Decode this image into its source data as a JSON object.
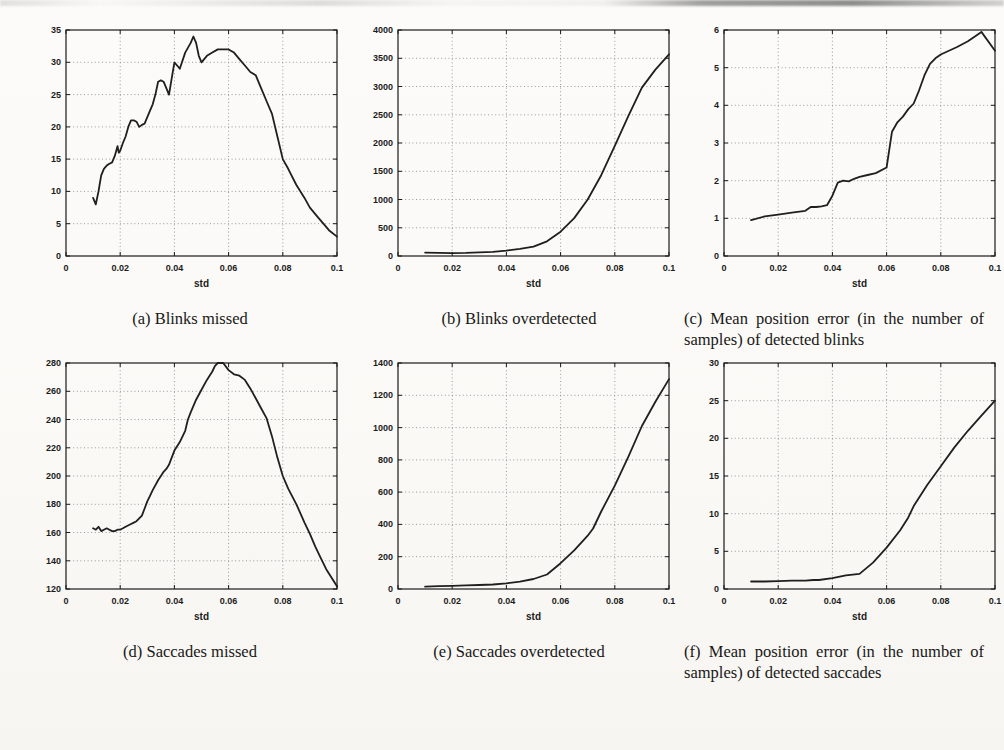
{
  "page": {
    "background": "#faf9f6",
    "scan_band_color": "#7a7a7a",
    "curve_color": "#1f1f1f",
    "grid_color": "#8f8f8f"
  },
  "chart_data": [
    {
      "id": "a",
      "type": "line",
      "caption": "(a) Blinks missed",
      "title": "",
      "xlabel": "std",
      "ylabel": "",
      "xlim": [
        0,
        0.1
      ],
      "ylim": [
        0,
        35
      ],
      "xticks": [
        0,
        0.02,
        0.04,
        0.06,
        0.08,
        0.1
      ],
      "xtick_labels": [
        "0",
        "0.02",
        "0.04",
        "0.06",
        "0.08",
        "0.1"
      ],
      "yticks": [
        0,
        5,
        10,
        15,
        20,
        25,
        30,
        35
      ],
      "ytick_labels": [
        "0",
        "5",
        "10",
        "15",
        "20",
        "25",
        "30",
        "35"
      ],
      "grid": "dotted",
      "legend": "none",
      "x": [
        0.01,
        0.011,
        0.012,
        0.013,
        0.014,
        0.015,
        0.016,
        0.017,
        0.018,
        0.019,
        0.0195,
        0.02,
        0.021,
        0.022,
        0.023,
        0.024,
        0.025,
        0.026,
        0.027,
        0.028,
        0.029,
        0.03,
        0.031,
        0.032,
        0.033,
        0.034,
        0.035,
        0.036,
        0.037,
        0.038,
        0.039,
        0.04,
        0.041,
        0.042,
        0.044,
        0.046,
        0.047,
        0.048,
        0.049,
        0.05,
        0.052,
        0.054,
        0.056,
        0.058,
        0.06,
        0.062,
        0.064,
        0.066,
        0.068,
        0.07,
        0.072,
        0.074,
        0.076,
        0.078,
        0.08,
        0.082,
        0.085,
        0.088,
        0.09,
        0.093,
        0.095,
        0.097,
        0.1
      ],
      "y": [
        9,
        8,
        10,
        12.5,
        13.5,
        14,
        14.3,
        14.5,
        15.5,
        17,
        16,
        16.3,
        17.5,
        18.5,
        20,
        21,
        21,
        20.8,
        20,
        20.3,
        20.5,
        21.5,
        22.5,
        23.5,
        25,
        27,
        27.2,
        27,
        26,
        25,
        27.5,
        30,
        29.5,
        29,
        31.5,
        33,
        34,
        33,
        31,
        30,
        31,
        31.5,
        32,
        32,
        32,
        31.5,
        30.5,
        29.5,
        28.5,
        28,
        26,
        24,
        22,
        18.5,
        15,
        13.5,
        11,
        9,
        7.5,
        6,
        5,
        4,
        3
      ]
    },
    {
      "id": "b",
      "type": "line",
      "caption": "(b) Blinks overdetected",
      "title": "",
      "xlabel": "std",
      "ylabel": "",
      "xlim": [
        0,
        0.1
      ],
      "ylim": [
        0,
        4000
      ],
      "xticks": [
        0,
        0.02,
        0.04,
        0.06,
        0.08,
        0.1
      ],
      "xtick_labels": [
        "0",
        "0.02",
        "0.04",
        "0.06",
        "0.08",
        "0.1"
      ],
      "yticks": [
        0,
        500,
        1000,
        1500,
        2000,
        2500,
        3000,
        3500,
        4000
      ],
      "ytick_labels": [
        "0",
        "500",
        "1000",
        "1500",
        "2000",
        "2500",
        "3000",
        "3500",
        "4000"
      ],
      "grid": "dotted",
      "legend": "none",
      "x": [
        0.01,
        0.015,
        0.02,
        0.025,
        0.03,
        0.035,
        0.04,
        0.045,
        0.05,
        0.055,
        0.06,
        0.065,
        0.07,
        0.075,
        0.08,
        0.085,
        0.09,
        0.095,
        0.1
      ],
      "y": [
        60,
        55,
        50,
        55,
        65,
        75,
        95,
        125,
        165,
        260,
        430,
        670,
        1000,
        1430,
        1950,
        2480,
        2980,
        3300,
        3570
      ]
    },
    {
      "id": "c",
      "type": "line",
      "caption": "(c) Mean position error (in the number of samples) of detected blinks",
      "title": "",
      "xlabel": "std",
      "ylabel": "",
      "xlim": [
        0,
        0.1
      ],
      "ylim": [
        0,
        6
      ],
      "xticks": [
        0,
        0.02,
        0.04,
        0.06,
        0.08,
        0.1
      ],
      "xtick_labels": [
        "0",
        "0.02",
        "0.04",
        "0.06",
        "0.08",
        "0.1"
      ],
      "yticks": [
        0,
        1,
        2,
        3,
        4,
        5,
        6
      ],
      "ytick_labels": [
        "0",
        "1",
        "2",
        "3",
        "4",
        "5",
        "6"
      ],
      "grid": "dotted",
      "legend": "none",
      "x": [
        0.01,
        0.015,
        0.02,
        0.025,
        0.03,
        0.032,
        0.034,
        0.036,
        0.038,
        0.04,
        0.042,
        0.044,
        0.046,
        0.048,
        0.05,
        0.053,
        0.056,
        0.06,
        0.062,
        0.064,
        0.066,
        0.068,
        0.07,
        0.072,
        0.074,
        0.076,
        0.078,
        0.08,
        0.083,
        0.086,
        0.09,
        0.093,
        0.095,
        0.1
      ],
      "y": [
        0.95,
        1.05,
        1.1,
        1.15,
        1.2,
        1.3,
        1.3,
        1.32,
        1.35,
        1.6,
        1.95,
        2.0,
        1.98,
        2.05,
        2.1,
        2.15,
        2.2,
        2.35,
        3.3,
        3.55,
        3.7,
        3.9,
        4.05,
        4.4,
        4.8,
        5.1,
        5.25,
        5.35,
        5.45,
        5.55,
        5.7,
        5.85,
        5.95,
        5.45
      ]
    },
    {
      "id": "d",
      "type": "line",
      "caption": "(d) Saccades missed",
      "title": "",
      "xlabel": "std",
      "ylabel": "",
      "xlim": [
        0,
        0.1
      ],
      "ylim": [
        120,
        280
      ],
      "xticks": [
        0,
        0.02,
        0.04,
        0.06,
        0.08,
        0.1
      ],
      "xtick_labels": [
        "0",
        "0.02",
        "0.04",
        "0.06",
        "0.08",
        "0.1"
      ],
      "yticks": [
        120,
        140,
        160,
        180,
        200,
        220,
        240,
        260,
        280
      ],
      "ytick_labels": [
        "120",
        "140",
        "160",
        "180",
        "200",
        "220",
        "240",
        "260",
        "280"
      ],
      "grid": "dotted",
      "legend": "none",
      "x": [
        0.01,
        0.011,
        0.012,
        0.013,
        0.014,
        0.015,
        0.016,
        0.017,
        0.018,
        0.019,
        0.02,
        0.021,
        0.022,
        0.024,
        0.025,
        0.026,
        0.027,
        0.028,
        0.029,
        0.03,
        0.031,
        0.032,
        0.034,
        0.035,
        0.036,
        0.037,
        0.038,
        0.039,
        0.04,
        0.042,
        0.044,
        0.045,
        0.046,
        0.048,
        0.05,
        0.052,
        0.054,
        0.055,
        0.056,
        0.058,
        0.06,
        0.062,
        0.064,
        0.066,
        0.068,
        0.07,
        0.072,
        0.074,
        0.076,
        0.078,
        0.08,
        0.082,
        0.085,
        0.088,
        0.09,
        0.092,
        0.094,
        0.096,
        0.098,
        0.1
      ],
      "y": [
        163,
        162,
        164,
        161,
        162,
        163,
        162,
        161,
        161,
        162,
        162,
        163,
        164,
        166,
        167,
        168,
        170,
        172,
        177,
        182,
        186,
        190,
        197,
        200,
        203,
        205,
        208,
        213,
        218,
        224,
        232,
        240,
        245,
        254,
        261,
        268,
        274,
        278,
        280,
        280,
        275,
        272,
        271,
        268,
        262,
        255,
        248,
        241,
        228,
        213,
        200,
        191,
        180,
        167,
        159,
        150,
        142,
        134,
        128,
        122
      ]
    },
    {
      "id": "e",
      "type": "line",
      "caption": "(e) Saccades overdetected",
      "title": "",
      "xlabel": "std",
      "ylabel": "",
      "xlim": [
        0,
        0.1
      ],
      "ylim": [
        0,
        1400
      ],
      "xticks": [
        0,
        0.02,
        0.04,
        0.06,
        0.08,
        0.1
      ],
      "xtick_labels": [
        "0",
        "0.02",
        "0.04",
        "0.06",
        "0.08",
        "0.1"
      ],
      "yticks": [
        0,
        200,
        400,
        600,
        800,
        1000,
        1200,
        1400
      ],
      "ytick_labels": [
        "0",
        "200",
        "400",
        "600",
        "800",
        "1000",
        "1200",
        "1400"
      ],
      "grid": "dotted",
      "legend": "none",
      "x": [
        0.01,
        0.015,
        0.02,
        0.025,
        0.03,
        0.035,
        0.04,
        0.045,
        0.05,
        0.055,
        0.06,
        0.065,
        0.07,
        0.072,
        0.075,
        0.08,
        0.085,
        0.09,
        0.095,
        0.1
      ],
      "y": [
        15,
        18,
        20,
        22,
        25,
        28,
        35,
        45,
        62,
        90,
        160,
        240,
        330,
        375,
        480,
        640,
        820,
        1010,
        1160,
        1300
      ]
    },
    {
      "id": "f",
      "type": "line",
      "caption": "(f) Mean position error (in the number of samples) of detected saccades",
      "title": "",
      "xlabel": "std",
      "ylabel": "",
      "xlim": [
        0,
        0.1
      ],
      "ylim": [
        0,
        30
      ],
      "xticks": [
        0,
        0.02,
        0.04,
        0.06,
        0.08,
        0.1
      ],
      "xtick_labels": [
        "0",
        "0.02",
        "0.04",
        "0.06",
        "0.08",
        "0.1"
      ],
      "yticks": [
        0,
        5,
        10,
        15,
        20,
        25,
        30
      ],
      "ytick_labels": [
        "0",
        "5",
        "10",
        "15",
        "20",
        "25",
        "30"
      ],
      "grid": "dotted",
      "legend": "none",
      "x": [
        0.01,
        0.015,
        0.02,
        0.025,
        0.03,
        0.033,
        0.035,
        0.04,
        0.045,
        0.05,
        0.055,
        0.06,
        0.065,
        0.068,
        0.07,
        0.075,
        0.08,
        0.085,
        0.09,
        0.095,
        0.1
      ],
      "y": [
        1.0,
        1.0,
        1.05,
        1.1,
        1.1,
        1.2,
        1.2,
        1.45,
        1.8,
        2.0,
        3.5,
        5.5,
        7.8,
        9.5,
        11,
        13.8,
        16.3,
        18.8,
        21,
        23,
        25
      ]
    }
  ]
}
